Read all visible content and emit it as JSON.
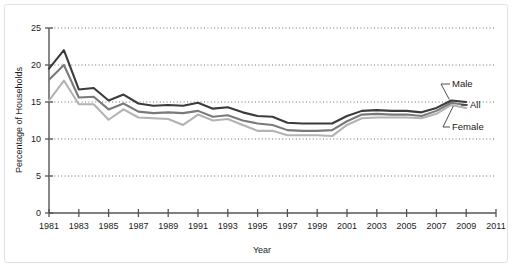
{
  "chart_data": {
    "type": "line",
    "title": "",
    "xlabel": "Year",
    "ylabel": "Percentage of Households",
    "xlim": [
      1981,
      2011
    ],
    "ylim": [
      0,
      25
    ],
    "grid": "horizontal-dotted",
    "legend_position": "right-inline-labels",
    "x": [
      1981,
      1982,
      1983,
      1984,
      1985,
      1986,
      1987,
      1988,
      1989,
      1990,
      1991,
      1992,
      1993,
      1994,
      1995,
      1996,
      1997,
      1998,
      1999,
      2000,
      2001,
      2002,
      2003,
      2004,
      2005,
      2006,
      2007,
      2008,
      2009
    ],
    "xticks": [
      1981,
      1983,
      1985,
      1987,
      1989,
      1991,
      1993,
      1995,
      1997,
      1999,
      2001,
      2003,
      2005,
      2007,
      2009,
      2011
    ],
    "xticklabels": [
      "1981",
      "1983",
      "1985",
      "1987",
      "1989",
      "1991",
      "1993",
      "1995",
      "1997",
      "1999",
      "2001",
      "2003",
      "2005",
      "2007",
      "2009",
      "2011"
    ],
    "yticks": [
      0,
      5,
      10,
      15,
      20,
      25
    ],
    "yticklabels": [
      "0",
      "5",
      "10",
      "15",
      "20",
      "25"
    ],
    "series": [
      {
        "name": "Male",
        "color": "#3b3b3b",
        "values": [
          19.5,
          22.0,
          16.7,
          16.9,
          15.2,
          16.0,
          14.8,
          14.5,
          14.6,
          14.5,
          14.9,
          14.1,
          14.3,
          13.6,
          13.1,
          13.0,
          12.2,
          12.1,
          12.1,
          12.1,
          13.1,
          13.8,
          13.9,
          13.8,
          13.8,
          13.6,
          14.2,
          15.2,
          15.0
        ]
      },
      {
        "name": "All",
        "color": "#7a7a7a",
        "values": [
          18.0,
          20.0,
          15.6,
          15.7,
          14.0,
          14.8,
          13.7,
          13.5,
          13.6,
          13.5,
          13.8,
          13.0,
          13.2,
          12.5,
          12.1,
          11.9,
          11.2,
          11.1,
          11.1,
          11.2,
          12.4,
          13.3,
          13.4,
          13.3,
          13.3,
          13.1,
          13.8,
          14.9,
          14.6
        ]
      },
      {
        "name": "Female",
        "color": "#b3b3b3",
        "values": [
          15.2,
          17.9,
          14.7,
          14.7,
          12.6,
          14.0,
          12.9,
          12.8,
          12.7,
          11.9,
          13.3,
          12.5,
          12.7,
          11.9,
          11.1,
          11.1,
          10.5,
          10.5,
          10.5,
          10.4,
          11.9,
          12.8,
          12.9,
          12.9,
          12.9,
          12.8,
          13.4,
          14.6,
          14.2
        ]
      }
    ],
    "annotations": [
      {
        "label": "Male",
        "series": "Male"
      },
      {
        "label": "All",
        "series": "All"
      },
      {
        "label": "Female",
        "series": "Female"
      }
    ]
  }
}
